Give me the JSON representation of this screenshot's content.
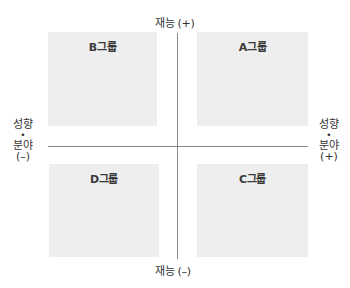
{
  "diagram": {
    "type": "quadrant-matrix",
    "axes": {
      "vertical": {
        "top_label": "재능 (+)",
        "bottom_label": "재능 (–)"
      },
      "horizontal": {
        "left_label": {
          "line1": "성향",
          "dot": "•",
          "line2": "분야",
          "line3": "(–)"
        },
        "right_label": {
          "line1": "성향",
          "dot": "•",
          "line2": "분야",
          "line3": "(+)"
        }
      }
    },
    "quadrants": {
      "top_left": "B그룹",
      "top_right": "A그룹",
      "bottom_left": "D그룹",
      "bottom_right": "C그룹"
    },
    "colors": {
      "quadrant_fill": "#eeeeee",
      "axis_line": "#8a8a8a",
      "text": "#333333"
    }
  }
}
